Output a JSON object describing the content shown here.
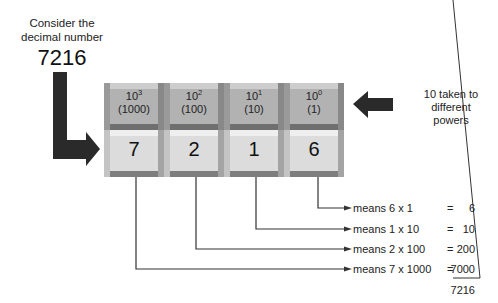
{
  "intro": {
    "line1": "Consider the",
    "line2": "decimal number",
    "number": "7216"
  },
  "powers": [
    {
      "base": "10",
      "exp": "3",
      "value": "(1000)"
    },
    {
      "base": "10",
      "exp": "2",
      "value": "(100)"
    },
    {
      "base": "10",
      "exp": "1",
      "value": "(10)"
    },
    {
      "base": "10",
      "exp": "0",
      "value": "(1)"
    }
  ],
  "digits": [
    "7",
    "2",
    "1",
    "6"
  ],
  "side_label": {
    "line1": "10 taken to",
    "line2": "different",
    "line3": "powers"
  },
  "expansion": [
    {
      "expr": "means 6 x 1",
      "eq": "=",
      "value": "6"
    },
    {
      "expr": "means 1 x 10",
      "eq": "=",
      "value": "10"
    },
    {
      "expr": "means 2 x 100",
      "eq": "=",
      "value": "200"
    },
    {
      "expr": "means 7 x 1000",
      "eq": "=",
      "value": "7000"
    }
  ],
  "total": "7216",
  "colors": {
    "arrow": "#2a2a2a",
    "line": "#333333",
    "grid_bg": "#8d8d8d"
  }
}
